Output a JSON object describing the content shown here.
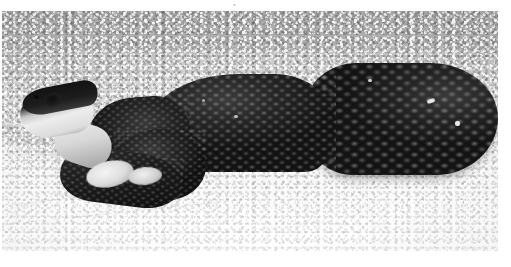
{
  "page": {
    "kind": "scanned-photograph",
    "paper_color": "#ffffff",
    "width": 511,
    "height": 267
  },
  "photo": {
    "caption": "Black-and-white photograph of a dark snake coiled on pale gravel",
    "subject": "snake",
    "medium": "black-and-white photograph",
    "frame": {
      "left": 2,
      "top": 11,
      "width": 496,
      "height": 240
    },
    "palette": {
      "background_top": "#a8a8a8",
      "background_bottom": "#fdfdfd",
      "snake_dark": "#141414",
      "snake_highlight": "#3c3c3c",
      "snout_light": "#ededed",
      "paper": "#ffffff"
    },
    "background": {
      "description": "granular gravel / coarse sand substrate",
      "gradient_note": "darker gray at top, brightening to near-white at the bottom",
      "rake_lines": 3
    },
    "snake": {
      "description": "large dark-bodied snake resting in a loose S-coil",
      "head_position": "upper-left, snout pointing left",
      "head_markings": "pale white snout, chin and throat with a dark crown and dark blotch",
      "eye": "small dark eye on the upper-left of the head",
      "body_description": "heavy dark body with clearly keeled, diamond-patterned scales",
      "coils": [
        {
          "name": "left-lower-coil",
          "note": "rounded loop resting in front of the head"
        },
        {
          "name": "mid-body-hump",
          "note": "arching section rising toward the centre"
        },
        {
          "name": "right-coil",
          "note": "large rounded loop filling the right third"
        }
      ],
      "highlights": "scattered pale specks and scale highlights across the right coil"
    },
    "margins": {
      "top": 11,
      "left": 2,
      "right": 13,
      "bottom": 16
    }
  }
}
